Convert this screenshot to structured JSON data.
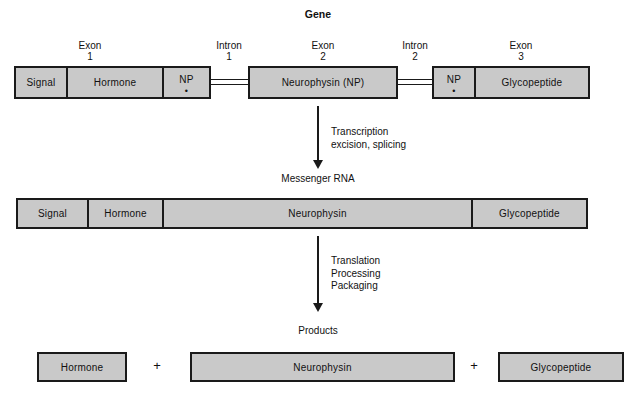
{
  "figure": {
    "gene": {
      "title": "Gene",
      "cap_labels": [
        {
          "line1": "Exon",
          "line2": "1"
        },
        {
          "line1": "Intron",
          "line2": "1"
        },
        {
          "line1": "Exon",
          "line2": "2"
        },
        {
          "line1": "Intron",
          "line2": "2"
        },
        {
          "line1": "Exon",
          "line2": "3"
        }
      ],
      "segments": [
        {
          "label": "Signal"
        },
        {
          "label": "Hormone"
        },
        {
          "label": "NP",
          "marker": "•"
        },
        {
          "label": "Neurophysin (NP)"
        },
        {
          "label": "NP",
          "marker": "•"
        },
        {
          "label": "Glycopeptide"
        }
      ]
    },
    "step1": {
      "arrow_text": "Transcription\nexcision, splicing"
    },
    "mrna": {
      "title": "Messenger RNA",
      "segments": [
        {
          "label": "Signal"
        },
        {
          "label": "Hormone"
        },
        {
          "label": "Neurophysin"
        },
        {
          "label": "Glycopeptide"
        }
      ]
    },
    "step2": {
      "arrow_text": "Translation\nProcessing\nPackaging"
    },
    "products": {
      "title": "Products",
      "segments": [
        {
          "label": "Hormone"
        },
        {
          "label": "Neurophysin"
        },
        {
          "label": "Glycopeptide"
        }
      ],
      "operators": [
        "+",
        "+"
      ]
    },
    "colors": {
      "box_fill": "#c9c9c9",
      "box_stroke": "#1a1a1a",
      "background": "#ffffff",
      "text": "#111111"
    }
  }
}
